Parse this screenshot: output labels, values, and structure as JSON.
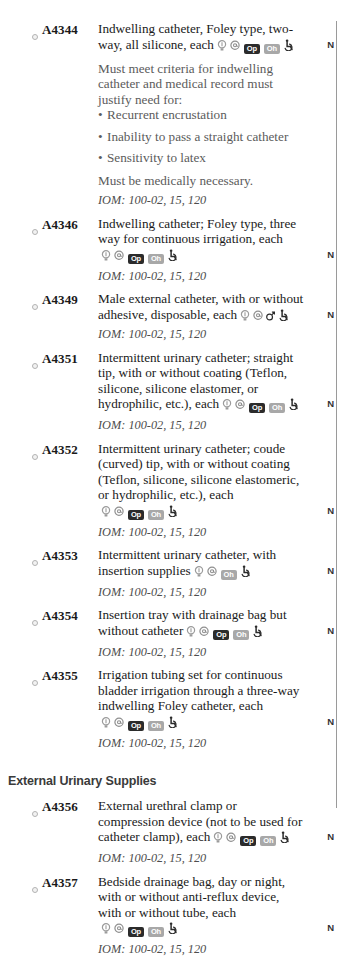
{
  "page": {
    "flag_letter": "N",
    "iom_reference": "IOM: 100-02, 15, 120",
    "colors": {
      "text": "#1a1a1a",
      "note_text": "#5b5b5b",
      "italic_text": "#4d4d4d",
      "badge_dark": "#2b2b2b",
      "badge_light": "#a8a8a8",
      "rule": "#9a9a9a",
      "background": "#ffffff"
    },
    "icon_labels": {
      "bulb": "bulb-icon",
      "at": "at-sign-icon",
      "op": "Op",
      "oh": "Oh",
      "male": "male-symbol-icon",
      "wheelchair": "wheelchair-accessibility-icon"
    }
  },
  "entries": [
    {
      "code": "A4344",
      "description": "Indwelling catheter, Foley type, two-way, all silicone, each",
      "icons": [
        "bulb",
        "at",
        "op",
        "oh",
        "wheelchair"
      ],
      "flag": "N",
      "notes": [
        "Must meet criteria for indwelling catheter and medical record must justify need for:"
      ],
      "bullets": [
        "Recurrent encrustation",
        "Inability to pass a straight catheter",
        "Sensitivity to latex"
      ],
      "notes_after": [
        "Must be medically necessary."
      ],
      "iom": "IOM: 100-02, 15, 120"
    },
    {
      "code": "A4346",
      "description": "Indwelling catheter; Foley type, three way for continuous irrigation, each",
      "icons": [
        "bulb",
        "at",
        "op",
        "oh",
        "wheelchair"
      ],
      "flag": "N",
      "notes": [],
      "bullets": [],
      "notes_after": [],
      "iom": "IOM: 100-02, 15, 120"
    },
    {
      "code": "A4349",
      "description": "Male external catheter, with or without adhesive, disposable, each",
      "icons": [
        "bulb",
        "at",
        "male",
        "wheelchair"
      ],
      "flag": "N",
      "notes": [],
      "bullets": [],
      "notes_after": [],
      "iom": "IOM: 100-02, 15, 120"
    },
    {
      "code": "A4351",
      "description": "Intermittent urinary catheter; straight tip, with or without coating (Teflon, silicone, silicone elastomer, or hydrophilic, etc.), each",
      "icons": [
        "bulb",
        "at",
        "op",
        "oh",
        "wheelchair"
      ],
      "flag": "N",
      "notes": [],
      "bullets": [],
      "notes_after": [],
      "iom": "IOM: 100-02, 15, 120"
    },
    {
      "code": "A4352",
      "description": "Intermittent urinary catheter; coude (curved) tip, with or without coating (Teflon, silicone, silicone elastomeric, or hydrophilic, etc.), each",
      "icons": [
        "bulb",
        "at",
        "op",
        "oh",
        "wheelchair"
      ],
      "flag": "N",
      "notes": [],
      "bullets": [],
      "notes_after": [],
      "iom": "IOM: 100-02, 15, 120"
    },
    {
      "code": "A4353",
      "description": "Intermittent urinary catheter, with insertion supplies",
      "icons": [
        "bulb",
        "at",
        "oh",
        "wheelchair"
      ],
      "flag": "N",
      "notes": [],
      "bullets": [],
      "notes_after": [],
      "iom": "IOM: 100-02, 15, 120"
    },
    {
      "code": "A4354",
      "description": "Insertion tray with drainage bag but without catheter",
      "icons": [
        "bulb",
        "at",
        "op",
        "oh",
        "wheelchair"
      ],
      "flag": "N",
      "notes": [],
      "bullets": [],
      "notes_after": [],
      "iom": "IOM: 100-02, 15, 120"
    },
    {
      "code": "A4355",
      "description": "Irrigation tubing set for continuous bladder irrigation through a three-way indwelling Foley catheter, each",
      "icons": [
        "bulb",
        "at",
        "op",
        "oh",
        "wheelchair"
      ],
      "flag": "N",
      "notes": [],
      "bullets": [],
      "notes_after": [],
      "iom": "IOM: 100-02, 15, 120"
    }
  ],
  "section": {
    "title": "External Urinary Supplies",
    "entries": [
      {
        "code": "A4356",
        "description": "External urethral clamp or compression device (not to be used for catheter clamp), each",
        "icons": [
          "bulb",
          "at",
          "op",
          "oh",
          "wheelchair"
        ],
        "flag": "N",
        "notes": [],
        "bullets": [],
        "notes_after": [],
        "iom": "IOM: 100-02, 15, 120"
      },
      {
        "code": "A4357",
        "description": "Bedside drainage bag, day or night, with or without anti-reflux device, with or without tube, each",
        "icons": [
          "bulb",
          "at",
          "op",
          "oh",
          "wheelchair"
        ],
        "flag": "N",
        "notes": [],
        "bullets": [],
        "notes_after": [],
        "iom": "IOM: 100-02, 15, 120"
      }
    ]
  }
}
